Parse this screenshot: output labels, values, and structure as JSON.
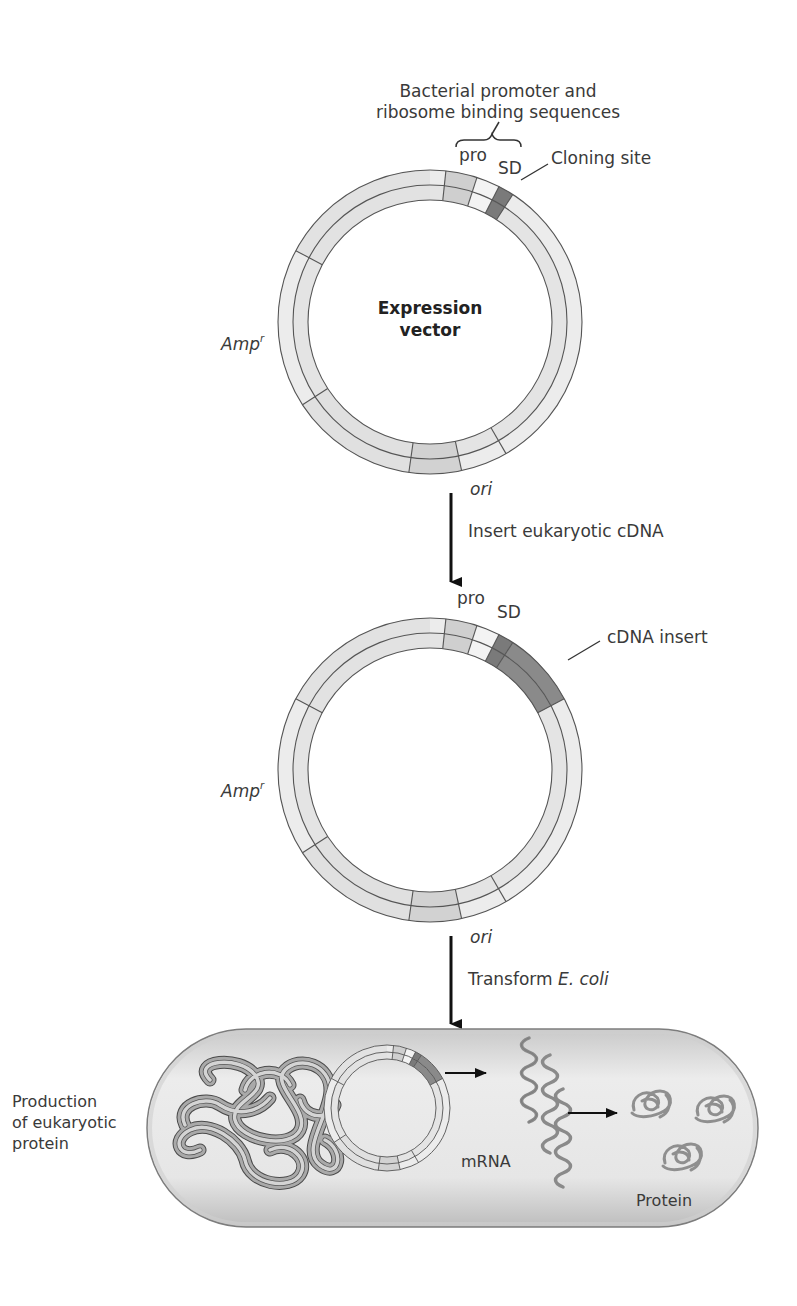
{
  "header": {
    "title_line1": "Bacterial promoter and",
    "title_line2": "ribosome binding sequences"
  },
  "vector1": {
    "center_label_line1": "Expression",
    "center_label_line2": "vector",
    "pro_label": "pro",
    "sd_label": "SD",
    "cloning_site_label": "Cloning site",
    "amp_label": "Amp",
    "amp_superscript": "r",
    "ori_label": "ori"
  },
  "step1": {
    "label": "Insert eukaryotic cDNA"
  },
  "vector2": {
    "pro_label": "pro",
    "sd_label": "SD",
    "insert_label": "cDNA insert",
    "amp_label": "Amp",
    "amp_superscript": "r",
    "ori_label": "ori"
  },
  "step2": {
    "label_prefix": "Transform ",
    "label_italic": "E. coli"
  },
  "cell": {
    "side_label_line1": "Production",
    "side_label_line2": "of eukaryotic",
    "side_label_line3": "protein",
    "mrna_label": "mRNA",
    "protein_label": "Protein"
  },
  "colors": {
    "band_light": "#ececec",
    "band_mid": "#d6d6d6",
    "pro_fill": "#cfcfcf",
    "sd_fill": "#f3f3f3",
    "cloning_site": "#7a7a7a",
    "insert_fill": "#8a8a8a",
    "ori_fill": "#d2d2d2",
    "outline": "#555555",
    "cell_fill": "#dedede",
    "cell_edge": "#8a8a8a",
    "arrow": "#111111"
  },
  "segments": {
    "vector1": [
      {
        "name": "pro",
        "start": 6,
        "end": 18,
        "fill": "pro_fill"
      },
      {
        "name": "sd",
        "start": 18,
        "end": 27,
        "fill": "sd_fill"
      },
      {
        "name": "cloning-site",
        "start": 27,
        "end": 33,
        "fill": "cloning_site"
      },
      {
        "name": "ori",
        "start": 168,
        "end": 188,
        "fill": "ori_fill"
      }
    ],
    "vector2": [
      {
        "name": "pro",
        "start": 6,
        "end": 18,
        "fill": "pro_fill"
      },
      {
        "name": "sd",
        "start": 18,
        "end": 27,
        "fill": "sd_fill"
      },
      {
        "name": "cloning-site",
        "start": 27,
        "end": 33,
        "fill": "cloning_site"
      },
      {
        "name": "cdna-insert",
        "start": 33,
        "end": 62,
        "fill": "insert_fill"
      },
      {
        "name": "ori",
        "start": 168,
        "end": 188,
        "fill": "ori_fill"
      }
    ],
    "dividers": [
      6,
      18,
      27,
      33,
      150,
      168,
      188,
      237,
      298
    ]
  }
}
